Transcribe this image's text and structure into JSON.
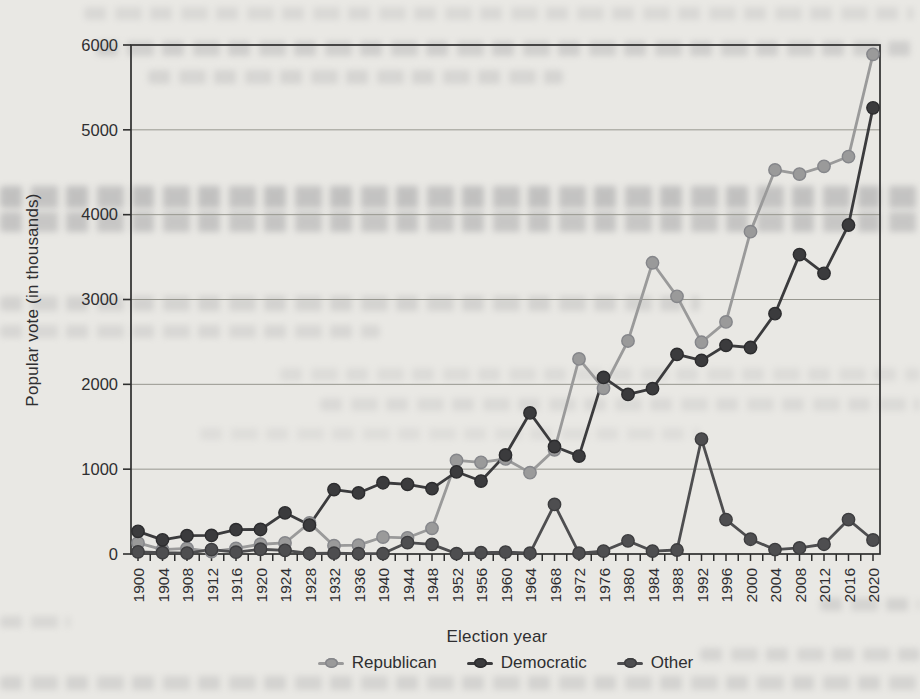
{
  "chart_data": {
    "type": "line",
    "title": "",
    "xlabel": "Election year",
    "ylabel": "Popular vote (in thousands)",
    "x": [
      1900,
      1904,
      1908,
      1912,
      1916,
      1920,
      1924,
      1928,
      1932,
      1936,
      1940,
      1944,
      1948,
      1952,
      1956,
      1960,
      1964,
      1968,
      1972,
      1976,
      1980,
      1984,
      1988,
      1992,
      1996,
      2000,
      2004,
      2008,
      2012,
      2016,
      2020
    ],
    "ylim": [
      0,
      6000
    ],
    "ytick_interval": 1000,
    "grid": "horizontal",
    "legend_position": "bottom",
    "series": [
      {
        "name": "Republican",
        "color": "#9a9a9a",
        "edge_color": "#85868a",
        "values": [
          131,
          51,
          66,
          28,
          65,
          115,
          130,
          367,
          98,
          104,
          200,
          191,
          303,
          1103,
          1081,
          1121,
          959,
          1228,
          2299,
          1953,
          2511,
          3433,
          3037,
          2496,
          2736,
          3800,
          4527,
          4479,
          4570,
          4685,
          5890
        ]
      },
      {
        "name": "Democratic",
        "color": "#3b3b3d",
        "edge_color": "#2c2c2e",
        "values": [
          267,
          167,
          217,
          219,
          287,
          289,
          485,
          341,
          760,
          720,
          840,
          821,
          770,
          969,
          860,
          1168,
          1663,
          1267,
          1154,
          2082,
          1881,
          1949,
          2352,
          2282,
          2460,
          2434,
          2833,
          3529,
          3308,
          3878,
          5259
        ]
      },
      {
        "name": "Other",
        "color": "#4e4e50",
        "edge_color": "#3d3d3f",
        "values": [
          26,
          15,
          11,
          52,
          21,
          56,
          43,
          6,
          10,
          4,
          5,
          135,
          114,
          4,
          15,
          23,
          9,
          584,
          9,
          35,
          155,
          35,
          47,
          1355,
          406,
          174,
          52,
          72,
          115,
          406,
          165
        ]
      }
    ]
  }
}
